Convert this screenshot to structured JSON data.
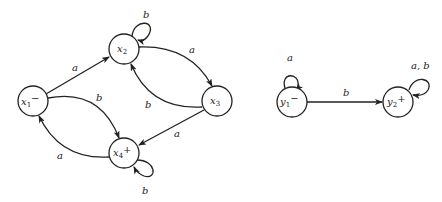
{
  "diagram": {
    "type": "finite-automata",
    "automata": [
      {
        "name": "X",
        "states": [
          {
            "id": "x1",
            "label": "x",
            "sub": "1",
            "mark": "−",
            "initial": true,
            "final": false
          },
          {
            "id": "x2",
            "label": "x",
            "sub": "2",
            "mark": "",
            "initial": false,
            "final": false
          },
          {
            "id": "x3",
            "label": "x",
            "sub": "3",
            "mark": "",
            "initial": false,
            "final": false
          },
          {
            "id": "x4",
            "label": "x",
            "sub": "4",
            "mark": "+",
            "initial": false,
            "final": true
          }
        ],
        "transitions": [
          {
            "from": "x1",
            "to": "x2",
            "label": "a"
          },
          {
            "from": "x1",
            "to": "x4",
            "label": "b"
          },
          {
            "from": "x2",
            "to": "x2",
            "label": "b"
          },
          {
            "from": "x2",
            "to": "x3",
            "label": "a"
          },
          {
            "from": "x3",
            "to": "x2",
            "label": "b"
          },
          {
            "from": "x3",
            "to": "x4",
            "label": "a"
          },
          {
            "from": "x4",
            "to": "x1",
            "label": "a"
          },
          {
            "from": "x4",
            "to": "x4",
            "label": "b"
          }
        ]
      },
      {
        "name": "Y",
        "states": [
          {
            "id": "y1",
            "label": "y",
            "sub": "1",
            "mark": "−",
            "initial": true,
            "final": false
          },
          {
            "id": "y2",
            "label": "y",
            "sub": "2",
            "mark": "+",
            "initial": false,
            "final": true
          }
        ],
        "transitions": [
          {
            "from": "y1",
            "to": "y1",
            "label": "a"
          },
          {
            "from": "y1",
            "to": "y2",
            "label": "b"
          },
          {
            "from": "y2",
            "to": "y2",
            "label": "a, b"
          }
        ]
      }
    ]
  },
  "labels": {
    "x1": {
      "main": "x",
      "sub": "1",
      "mark": "−"
    },
    "x2": {
      "main": "x",
      "sub": "2",
      "mark": ""
    },
    "x3": {
      "main": "x",
      "sub": "3",
      "mark": ""
    },
    "x4": {
      "main": "x",
      "sub": "4",
      "mark": "+"
    },
    "y1": {
      "main": "y",
      "sub": "1",
      "mark": "−"
    },
    "y2": {
      "main": "y",
      "sub": "2",
      "mark": "+"
    },
    "e_x1_x2": "a",
    "e_x1_x4": "b",
    "e_x2_loop": "b",
    "e_x2_x3": "a",
    "e_x3_x2": "b",
    "e_x3_x4": "a",
    "e_x4_x1": "a",
    "e_x4_loop": "b",
    "e_y1_loop": "a",
    "e_y1_y2": "b",
    "e_y2_loop": "a, b"
  }
}
